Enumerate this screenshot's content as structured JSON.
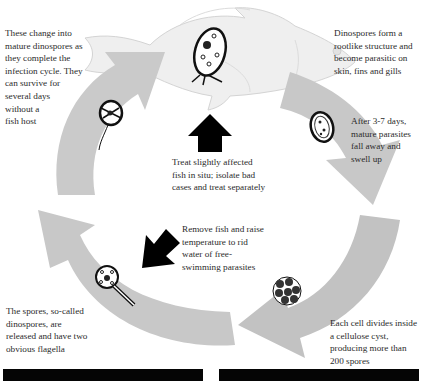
{
  "diagram": {
    "title": "",
    "type": "life-cycle",
    "colors": {
      "background": "#ffffff",
      "cycle_arrow": "#c4c4c4",
      "cycle_arrow_light": "#dadada",
      "fish_body": "#eeeeee",
      "fish_outline": "#d6d6d6",
      "treatment_arrow": "#000000",
      "text": "#2b2b2b",
      "bottom_bars": "#050505"
    },
    "stages": [
      {
        "id": "attached",
        "text": "Dinospores form a\nrootlike structure and\nbecome parasitic on\nskin, fins and gills",
        "icon": "attached-parasite-icon"
      },
      {
        "id": "fall-away",
        "text": "After 3-7 days,\nmature parasites\nfall away and\nswell up",
        "icon": "mature-parasite-icon"
      },
      {
        "id": "cyst",
        "text": "Each cell divides inside\na cellulose cyst,\nproducing more than\n200 spores",
        "icon": "cyst-icon"
      },
      {
        "id": "dinospores-released",
        "text": "The spores, so-called\ndinospores, are\nreleased and have two\nobvious flagella",
        "icon": "dinospore-icon"
      },
      {
        "id": "mature-dinospores",
        "text": "These change into\nmature dinospores as\nthey complete the\ninfection cycle. They\ncan survive for\nseveral days\nwithout a\nfish host",
        "icon": "free-swimming-dinospore-icon"
      }
    ],
    "treatments": [
      {
        "id": "treat-in-situ",
        "text": "Treat slightly affected\nfish in situ; isolate bad\ncases and treat separately",
        "arrow_direction": "up"
      },
      {
        "id": "remove-fish",
        "text": "Remove fish and raise\ntemperature to rid\nwater of free-\nswimming parasites",
        "arrow_direction": "down-left"
      }
    ]
  }
}
